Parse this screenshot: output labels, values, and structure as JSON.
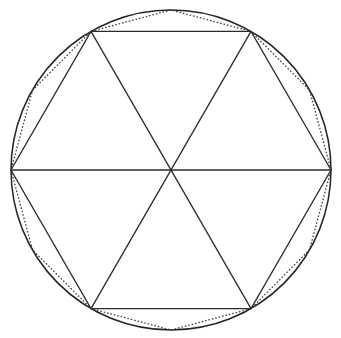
{
  "figure": {
    "name": "circle-with-inscribed-hexagon-and-dodecagon",
    "background_color": "#ffffff",
    "canvas": {
      "width": 341,
      "height": 338
    }
  },
  "chart_data": {
    "type": "scatter",
    "title": "",
    "subtitle": "",
    "xlabel": "",
    "ylabel": "",
    "grid": false,
    "legend": null,
    "annotations": [],
    "shapes": [
      {
        "name": "circle",
        "kind": "circle",
        "stroke": "#232323",
        "stroke_style": "solid",
        "stroke_width": 1.5,
        "center": [
          171,
          170
        ],
        "radius": 160
      },
      {
        "name": "hexagon",
        "kind": "polygon",
        "sides": 6,
        "stroke": "#2b2b2b",
        "stroke_style": "solid",
        "stroke_width": 1.3,
        "circumradius": 160,
        "rotation_deg": 0,
        "vertices": [
          [
            331,
            170
          ],
          [
            251,
            31.4
          ],
          [
            91,
            31.4
          ],
          [
            11,
            170
          ],
          [
            91,
            308.6
          ],
          [
            251,
            308.6
          ]
        ]
      },
      {
        "name": "diameters",
        "kind": "lines",
        "stroke": "#2b2b2b",
        "stroke_style": "solid",
        "stroke_width": 1.3,
        "segments": [
          [
            [
              11,
              170
            ],
            [
              331,
              170
            ]
          ],
          [
            [
              91,
              31.4
            ],
            [
              251,
              308.6
            ]
          ],
          [
            [
              251,
              31.4
            ],
            [
              91,
              308.6
            ]
          ]
        ]
      },
      {
        "name": "dodecagon",
        "kind": "polygon",
        "sides": 12,
        "stroke": "#3a3a3a",
        "stroke_style": "dotted",
        "stroke_width": 1.25,
        "circumradius": 160,
        "rotation_deg": 0,
        "vertices": [
          [
            331,
            170
          ],
          [
            309.5,
            90.2
          ],
          [
            251,
            31.4
          ],
          [
            171,
            10
          ],
          [
            91,
            31.4
          ],
          [
            32.5,
            90.2
          ],
          [
            11,
            170
          ],
          [
            32.5,
            249.8
          ],
          [
            91,
            308.6
          ],
          [
            171,
            330
          ],
          [
            251,
            308.6
          ],
          [
            309.5,
            249.8
          ]
        ]
      }
    ]
  }
}
